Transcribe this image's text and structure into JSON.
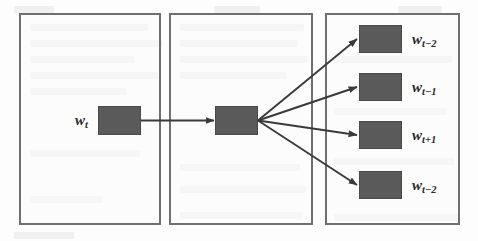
{
  "diagram": {
    "type": "skip-gram-style fan-out diagram",
    "background_color": "#fdfdfd",
    "box_fill_color": "#5a5a5a",
    "box_border_color": "#4a4a4a",
    "panel_border_color": "#6f6f6f",
    "edge_color": "#3a3a3a",
    "panels": [
      {
        "id": "input-panel",
        "name": "input-layer-panel"
      },
      {
        "id": "projection-panel",
        "name": "projection-layer-panel"
      },
      {
        "id": "output-panel",
        "name": "output-layer-panel"
      }
    ],
    "input": {
      "label_w": "w",
      "label_sub": "t"
    },
    "projection": {
      "label_w": "",
      "label_sub": ""
    },
    "outputs": [
      {
        "label_w": "w",
        "label_sub": "t−2"
      },
      {
        "label_w": "w",
        "label_sub": "t−1"
      },
      {
        "label_w": "w",
        "label_sub": "t+1"
      },
      {
        "label_w": "w",
        "label_sub": "t−2"
      }
    ],
    "edges": [
      {
        "from": "input-box",
        "to": "projection-box",
        "style": "straight-arrow"
      },
      {
        "from": "projection-box",
        "to": "output-box-1",
        "style": "straight-arrow"
      },
      {
        "from": "projection-box",
        "to": "output-box-2",
        "style": "straight-arrow"
      },
      {
        "from": "projection-box",
        "to": "output-box-3",
        "style": "straight-arrow"
      },
      {
        "from": "projection-box",
        "to": "output-box-4",
        "style": "straight-arrow"
      }
    ]
  },
  "ghost_text": {
    "note": "faint reverse-side print bleed-through visible in the scan"
  }
}
